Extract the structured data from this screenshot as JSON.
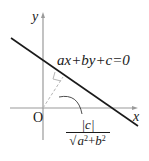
{
  "diagram": {
    "axes": {
      "x_label": "x",
      "y_label": "y",
      "origin_label": "O"
    },
    "line": {
      "equation": "ax+by+c=0"
    },
    "distance": {
      "numerator": "|c|",
      "radical_symbol": "√",
      "denominator_a": "a",
      "denominator_plus": "+",
      "denominator_b": "b",
      "exponent": "2",
      "full_text": "|c| / √(a²+b²)"
    },
    "colors": {
      "axis": "#9a9a9a",
      "line": "#1a1a1a",
      "perpendicular": "#b5b5b5",
      "leader": "#3a3a3a",
      "text": "#1a1a1a",
      "background": "#ffffff"
    }
  }
}
